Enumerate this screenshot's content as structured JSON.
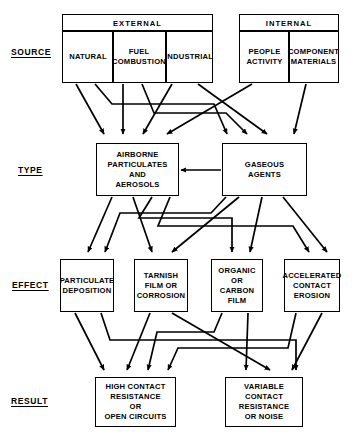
{
  "diagram": {
    "rows": [
      {
        "id": "source",
        "label": "SOURCE"
      },
      {
        "id": "type",
        "label": "TYPE"
      },
      {
        "id": "effect",
        "label": "EFFECT"
      },
      {
        "id": "result",
        "label": "RESULT"
      }
    ],
    "groups": [
      {
        "id": "external",
        "title": "EXTERNAL"
      },
      {
        "id": "internal",
        "title": "INTERNAL"
      }
    ],
    "source_nodes": [
      {
        "id": "natural",
        "group": "external",
        "label": "NATURAL"
      },
      {
        "id": "fuel-combustion",
        "group": "external",
        "line1": "FUEL",
        "line2": "COMBUSTION"
      },
      {
        "id": "industrial",
        "group": "external",
        "label": "INDUSTRIAL"
      },
      {
        "id": "people-activity",
        "group": "internal",
        "line1": "PEOPLE",
        "line2": "ACTIVITY"
      },
      {
        "id": "component-materials",
        "group": "internal",
        "line1": "COMPONENT",
        "line2": "MATERIALS"
      }
    ],
    "type_nodes": [
      {
        "id": "airborne-particulates",
        "line1": "AIRBORNE",
        "line2": "PARTICULATES",
        "line3": "AND",
        "line4": "AEROSOLS"
      },
      {
        "id": "gaseous-agents",
        "line1": "GASEOUS",
        "line2": "AGENTS"
      }
    ],
    "effect_nodes": [
      {
        "id": "particulate-deposition",
        "line1": "PARTICULATE",
        "line2": "DEPOSITION"
      },
      {
        "id": "tarnish-film-corrosion",
        "line1": "TARNISH",
        "line2": "FILM OR",
        "line3": "CORROSION"
      },
      {
        "id": "organic-carbon-film",
        "line1": "ORGANIC",
        "line2": "OR CARBON",
        "line3": "FILM"
      },
      {
        "id": "accelerated-contact-erosion",
        "line1": "ACCELERATED",
        "line2": "CONTACT",
        "line3": "EROSION"
      }
    ],
    "result_nodes": [
      {
        "id": "high-contact-resistance",
        "line1": "HIGH  CONTACT",
        "line2": "RESISTANCE",
        "line3": "OR",
        "line4": "OPEN  CIRCUITS"
      },
      {
        "id": "variable-contact-resistance",
        "line1": "VARIABLE",
        "line2": "CONTACT",
        "line3": "RESISTANCE",
        "line4": "OR  NOISE"
      }
    ],
    "colors": {
      "stroke": "#000000",
      "background": "#ffffff"
    }
  }
}
